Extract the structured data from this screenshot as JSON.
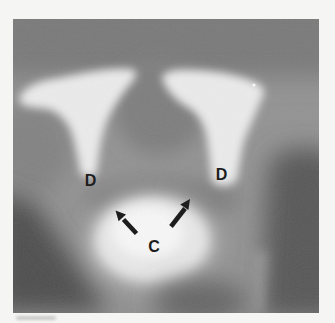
{
  "figure": {
    "kind": "radiograph",
    "labels": {
      "d_left": "D",
      "d_right": "D",
      "c": "C"
    },
    "annotation": {
      "ink_color": "#1d1d1d",
      "arrows": [
        {
          "name": "left-arrow",
          "direction": "up-left"
        },
        {
          "name": "right-arrow",
          "direction": "up-right"
        }
      ]
    },
    "colors": {
      "page_background": "#f5f5f3",
      "film_base": "#8f8f8f",
      "bone_bright": "#ededed",
      "contrast_core": "#fafafa",
      "deep_shadow": "#464646"
    }
  }
}
